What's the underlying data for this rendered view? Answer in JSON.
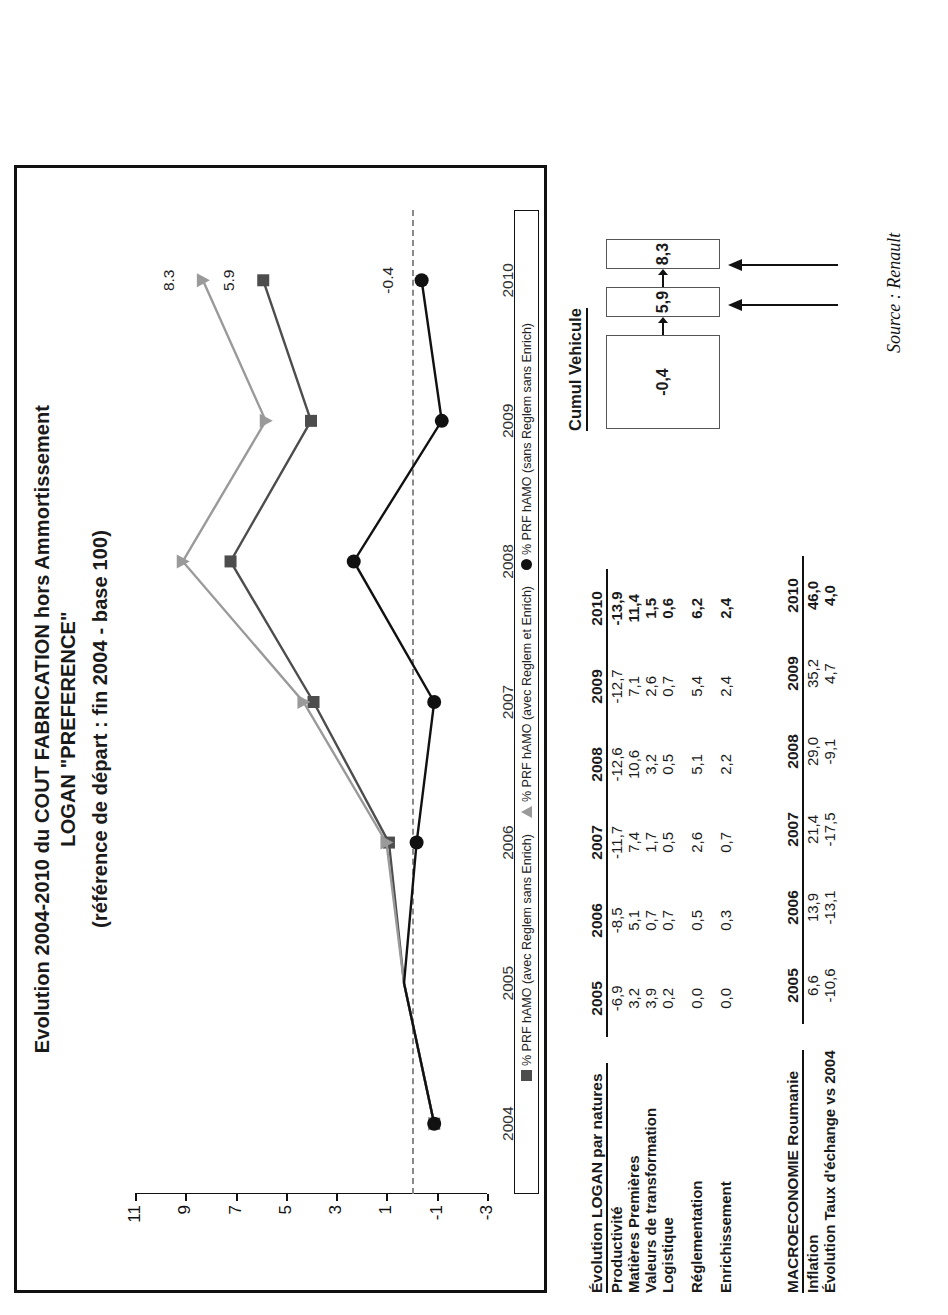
{
  "chart_data": {
    "type": "line",
    "title": "Evolution 2004-2010 du COUT FABRICATION hors Ammortissement",
    "title_line2": "LOGAN \"PREFERENCE\"",
    "title_line3": "(référence de départ : fin 2004 - base 100)",
    "xlabel": "",
    "ylabel": "",
    "x": [
      "2004",
      "2005",
      "2006",
      "2007",
      "2008",
      "2009",
      "2010"
    ],
    "ylim": [
      -3,
      11
    ],
    "yticks": [
      "11",
      "9",
      "7",
      "5",
      "3",
      "1",
      "-1",
      "-3"
    ],
    "ytick_values": [
      11,
      9,
      7,
      5,
      3,
      1,
      -1,
      -3
    ],
    "grid": false,
    "reference_line": 0,
    "legend_position": "bottom",
    "series": [
      {
        "name": "% PRF hAMO (avec Reglem sans Enrich)",
        "marker": "square",
        "color": "#4d4d4d",
        "values": [
          -0.9,
          0.3,
          0.9,
          3.9,
          7.2,
          4.0,
          5.9
        ],
        "end_label": "5.9"
      },
      {
        "name": "% PRF hAMO (avec Reglem et Enrich)",
        "marker": "triangle",
        "color": "#9a9a9a",
        "values": [
          -0.9,
          0.3,
          1.0,
          4.3,
          9.1,
          5.8,
          8.3
        ],
        "end_label": "8.3"
      },
      {
        "name": "% PRF hAMO (sans Reglem sans Enrich)",
        "marker": "circle",
        "color": "#111111",
        "values": [
          -0.9,
          0.3,
          -0.2,
          -0.9,
          2.3,
          -1.2,
          -0.4
        ],
        "end_label": "-0.4"
      }
    ],
    "data_labels": [
      {
        "text": "8.3",
        "series": "% PRF hAMO (avec Reglem et Enrich)",
        "x": "2010"
      },
      {
        "text": "5.9",
        "series": "% PRF hAMO (avec Reglem sans Enrich)",
        "x": "2010"
      },
      {
        "text": "-0.4",
        "series": "% PRF hAMO (sans Reglem sans Enrich)",
        "x": "2010"
      }
    ]
  },
  "tables": {
    "logan": {
      "title": "Évolution LOGAN par natures",
      "columns": [
        "2005",
        "2006",
        "2007",
        "2008",
        "2009",
        "2010"
      ],
      "rows": [
        {
          "label": "Productivité",
          "values": [
            "-6,9",
            "-8,5",
            "-11,7",
            "-12,6",
            "-12,7",
            "-13,9"
          ]
        },
        {
          "label": "Matières Premières",
          "values": [
            "3,2",
            "5,1",
            "7,4",
            "10,6",
            "7,1",
            "11,4"
          ]
        },
        {
          "label": "Valeurs de transformation",
          "values": [
            "3,9",
            "0,7",
            "1,7",
            "3,2",
            "2,6",
            "1,5"
          ]
        },
        {
          "label": "Logistique",
          "values": [
            "0,2",
            "0,7",
            "0,5",
            "0,5",
            "0,7",
            "0,6"
          ]
        },
        {
          "label": "Réglementation",
          "values": [
            "0,0",
            "0,5",
            "2,6",
            "5,1",
            "5,4",
            "6,2"
          ]
        },
        {
          "label": "Enrichissement",
          "values": [
            "0,0",
            "0,3",
            "0,7",
            "2,2",
            "2,4",
            "2,4"
          ]
        }
      ]
    },
    "macro": {
      "title": "MACROECONOMIE Roumanie",
      "columns": [
        "2005",
        "2006",
        "2007",
        "2008",
        "2009",
        "2010"
      ],
      "rows": [
        {
          "label": "Inflation",
          "values": [
            "6,6",
            "13,9",
            "21,4",
            "29,0",
            "35,2",
            "46,0"
          ]
        },
        {
          "label": "Évolution Taux d'échange vs 2004",
          "values": [
            "-10,6",
            "-13,1",
            "-17,5",
            "-9,1",
            "4,7",
            "4,0"
          ]
        }
      ]
    }
  },
  "cumul": {
    "title": "Cumul Vehicule",
    "boxes": [
      "-0,4",
      "5,9",
      "8,3"
    ]
  },
  "source": "Source : Renault"
}
